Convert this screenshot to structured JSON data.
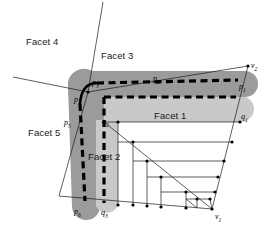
{
  "figure": {
    "type": "geometric-diagram",
    "background_color": "#ffffff",
    "colors": {
      "region_dark_gray": "#9b9b9b",
      "region_light_gray": "#c9c9c9",
      "dashed_path": "#000000",
      "thin_line": "#1a1a1a",
      "vertex_dot": "#000000",
      "text": "#1a1a1a"
    }
  },
  "facet_labels": [
    {
      "id": "facet-1",
      "text": "Facet 1",
      "x": 154,
      "y": 110
    },
    {
      "id": "facet-2",
      "text": "Facet 2",
      "x": 88,
      "y": 151
    },
    {
      "id": "facet-3",
      "text": "Facet 3",
      "x": 101,
      "y": 50
    },
    {
      "id": "facet-4",
      "text": "Facet 4",
      "x": 26,
      "y": 36
    },
    {
      "id": "facet-5",
      "text": "Facet 5",
      "x": 28,
      "y": 127
    }
  ],
  "point_labels": [
    {
      "id": "p1",
      "base": "p",
      "sub": "1",
      "x": 239,
      "y": 83
    },
    {
      "id": "p2",
      "base": "p",
      "sub": "2",
      "x": 153,
      "y": 75
    },
    {
      "id": "p3",
      "base": "p",
      "sub": "3",
      "x": 92,
      "y": 79
    },
    {
      "id": "p4",
      "base": "p",
      "sub": "4",
      "x": 74,
      "y": 96
    },
    {
      "id": "p5",
      "base": "p",
      "sub": "5",
      "x": 64,
      "y": 119
    },
    {
      "id": "p6",
      "base": "p",
      "sub": "6",
      "x": 74,
      "y": 208
    },
    {
      "id": "q1",
      "base": "q",
      "sub": "1",
      "x": 241,
      "y": 113
    },
    {
      "id": "q2",
      "base": "q",
      "sub": "2",
      "x": 102,
      "y": 118
    },
    {
      "id": "q3",
      "base": "q",
      "sub": "3",
      "x": 101,
      "y": 209
    },
    {
      "id": "v1",
      "base": "v",
      "sub": "1",
      "x": 215,
      "y": 213
    },
    {
      "id": "v2",
      "base": "v",
      "sub": "2",
      "x": 251,
      "y": 62
    }
  ]
}
